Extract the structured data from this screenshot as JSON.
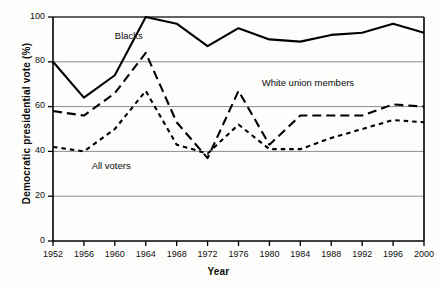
{
  "chart_data": {
    "type": "line",
    "title": "",
    "subtitle": "",
    "xlabel": "Year",
    "ylabel": "Democratic presidential vote (%)",
    "x": [
      1952,
      1956,
      1960,
      1964,
      1968,
      1972,
      1976,
      1980,
      1984,
      1988,
      1992,
      1996,
      2000
    ],
    "xtick_labels": [
      "1952",
      "1956",
      "1960",
      "1964",
      "1968",
      "1972",
      "1976",
      "1980",
      "1984",
      "1988",
      "1992",
      "1996",
      "2000"
    ],
    "ytick_labels": [
      "0",
      "20",
      "40",
      "60",
      "80",
      "100"
    ],
    "yticks": [
      0,
      20,
      40,
      60,
      80,
      100
    ],
    "ylim": [
      0,
      100
    ],
    "xlim": [
      1952,
      2000
    ],
    "grid": "horizontal",
    "legend_position": "inline-annotations",
    "series": [
      {
        "name": "Blacks",
        "style": "solid",
        "color": "#000000",
        "label_x": 1960,
        "label_y": 91,
        "values": [
          80,
          64,
          74,
          100,
          97,
          87,
          95,
          90,
          89,
          92,
          93,
          97,
          93
        ]
      },
      {
        "name": "White union members",
        "style": "long-dash",
        "color": "#000000",
        "label_x": 1979,
        "label_y": 70,
        "values": [
          58,
          56,
          66,
          84,
          53,
          37,
          67,
          43,
          56,
          56,
          56,
          61,
          60
        ]
      },
      {
        "name": "All voters",
        "style": "short-dash",
        "color": "#000000",
        "label_x": 1957,
        "label_y": 33,
        "values": [
          42,
          40,
          50,
          67,
          43,
          39,
          52,
          41,
          41,
          46,
          50,
          54,
          53
        ]
      }
    ],
    "annotations": [
      {
        "text": "Blacks",
        "x": 1960,
        "y": 91
      },
      {
        "text": "White union members",
        "x": 1979,
        "y": 70
      },
      {
        "text": "All voters",
        "x": 1957,
        "y": 33
      }
    ]
  }
}
